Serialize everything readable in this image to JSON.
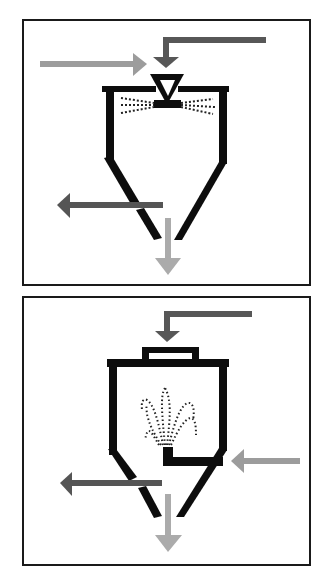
{
  "diagram": {
    "title": "Spray drying vs fluid-bed agglomeration process schematic",
    "panels": [
      {
        "id": "top",
        "description": "Spray drying chamber with top atomizing nozzle",
        "frame": {
          "x": 22,
          "y": 20,
          "w": 288,
          "h": 265
        },
        "flows": [
          {
            "name": "drying-air-inlet",
            "direction": "right",
            "color": "#9a9a9a"
          },
          {
            "name": "feed-inlet",
            "direction": "down",
            "color": "#5a5a5a"
          },
          {
            "name": "exhaust-air-outlet",
            "direction": "left",
            "color": "#555555"
          },
          {
            "name": "product-outlet",
            "direction": "down",
            "color": "#a8a8a8"
          }
        ],
        "nozzle": "inverted-triangle atomizer",
        "spray": "horizontal dotted spray pattern"
      },
      {
        "id": "bottom",
        "description": "Chamber with bottom fountain nozzle and top inlet",
        "frame": {
          "x": 22,
          "y": 297,
          "w": 288,
          "h": 268
        },
        "flows": [
          {
            "name": "feed-inlet",
            "direction": "down",
            "color": "#5a5a5a"
          },
          {
            "name": "side-air-inlet",
            "direction": "left",
            "color": "#9a9a9a"
          },
          {
            "name": "exhaust-air-outlet",
            "direction": "left",
            "color": "#555555"
          },
          {
            "name": "product-outlet",
            "direction": "down",
            "color": "#a8a8a8"
          }
        ],
        "nozzle": "L-shaped bottom nozzle",
        "spray": "upward dotted fountain pattern"
      }
    ],
    "colors": {
      "vessel": "#111111",
      "frame": "#1a1a1a",
      "arrow_dark": "#575757",
      "arrow_light": "#9c9c9c",
      "arrow_lightest": "#ababab",
      "spray": "#222222",
      "background": "#ffffff"
    }
  }
}
